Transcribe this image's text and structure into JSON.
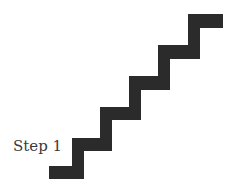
{
  "diagram": {
    "label": "Step 1",
    "stair_color": "#2b2b2b",
    "step_count": 6
  }
}
